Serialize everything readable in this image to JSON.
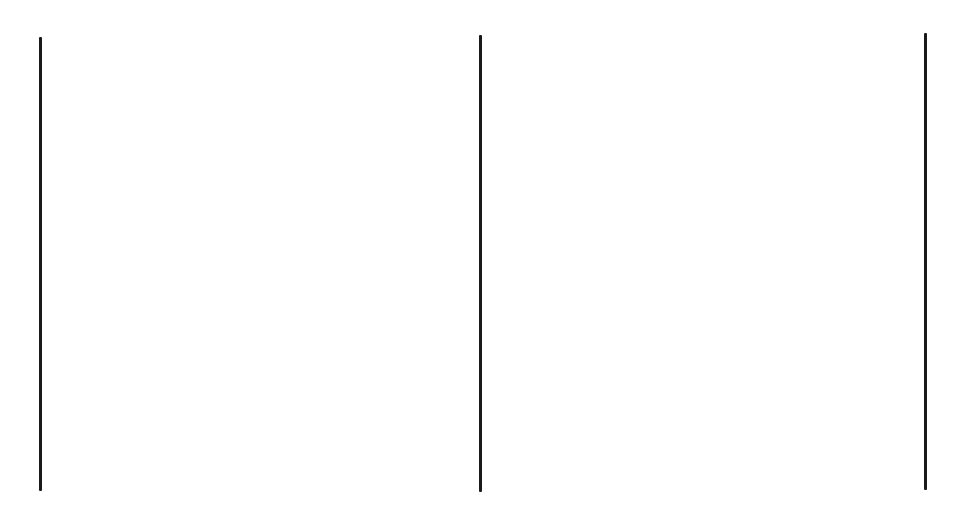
{
  "page": {
    "type": "scanned-document-page",
    "background_color": "#ffffff",
    "ink_color": "#1a1a1a",
    "width": 961,
    "height": 505,
    "content_note": "Two-column scanned page; all text is rendered as rectangular blocks of halftone dot squares, no legible characters visible."
  },
  "rules": [
    {
      "id": "left-margin-rule",
      "x": 39,
      "y": 37,
      "width": 3,
      "height": 454
    },
    {
      "id": "center-column-rule",
      "x": 479,
      "y": 35,
      "width": 3,
      "height": 457
    },
    {
      "id": "right-margin-rule",
      "x": 924,
      "y": 33,
      "width": 3,
      "height": 457
    }
  ],
  "columns": [
    {
      "id": "left-column",
      "blocks": [
        {
          "x": 58,
          "y": 40,
          "width": 380,
          "height": 38
        },
        {
          "x": 73,
          "y": 113,
          "width": 380,
          "height": 38
        },
        {
          "x": 90,
          "y": 188,
          "width": 378,
          "height": 38
        },
        {
          "x": 58,
          "y": 302,
          "width": 412,
          "height": 43
        },
        {
          "x": 88,
          "y": 376,
          "width": 354,
          "height": 42
        },
        {
          "x": 122,
          "y": 451,
          "width": 285,
          "height": 43
        }
      ]
    },
    {
      "id": "right-column",
      "blocks": [
        {
          "x": 497,
          "y": 40,
          "width": 416,
          "height": 38
        },
        {
          "x": 537,
          "y": 113,
          "width": 376,
          "height": 38
        },
        {
          "x": 537,
          "y": 188,
          "width": 376,
          "height": 38
        },
        {
          "x": 497,
          "y": 302,
          "width": 416,
          "height": 43
        },
        {
          "x": 497,
          "y": 375,
          "width": 416,
          "height": 43
        },
        {
          "x": 497,
          "y": 450,
          "width": 416,
          "height": 42
        }
      ]
    }
  ],
  "dot_pattern": {
    "cell_width": 7.4,
    "dot_width": 5,
    "rows_per_block": 5,
    "vertical_gap": 2.8
  }
}
